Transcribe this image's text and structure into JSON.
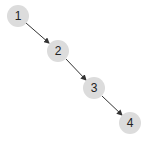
{
  "diagram": {
    "type": "linked-list",
    "node_color": "#dcdcdc",
    "edge_color": "#333333",
    "nodes": [
      {
        "id": "1",
        "label": "1",
        "x": 18,
        "y": 16
      },
      {
        "id": "2",
        "label": "2",
        "x": 58,
        "y": 51
      },
      {
        "id": "3",
        "label": "3",
        "x": 94,
        "y": 88
      },
      {
        "id": "4",
        "label": "4",
        "x": 130,
        "y": 123
      }
    ],
    "edges": [
      {
        "from": "1",
        "to": "2"
      },
      {
        "from": "2",
        "to": "3"
      },
      {
        "from": "3",
        "to": "4"
      }
    ]
  }
}
